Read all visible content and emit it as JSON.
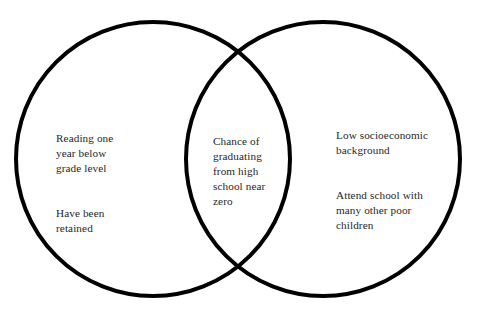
{
  "figure": {
    "type": "venn-diagram",
    "background_color": "#ffffff",
    "stroke_color": "#000000",
    "text_color": "#262626",
    "stroke_width": 4,
    "width": 488,
    "height": 317
  },
  "circles": {
    "left": {
      "name": "left-circle",
      "cx": 153,
      "cy": 159,
      "r": 137
    },
    "right": {
      "name": "right-circle",
      "cx": 323,
      "cy": 159,
      "r": 137
    }
  },
  "regions": {
    "left_only": {
      "label": "left-set",
      "paragraphs": [
        "Reading one\nyear below\ngrade level",
        "Have been\nretained"
      ]
    },
    "overlap": {
      "label": "intersection-set",
      "paragraphs": [
        "Chance of\ngraduating\nfrom high\nschool near\nzero"
      ]
    },
    "right_only": {
      "label": "right-set",
      "paragraphs": [
        "Low socioeconomic\nbackground",
        "Attend school with\nmany other poor\nchildren"
      ]
    }
  }
}
